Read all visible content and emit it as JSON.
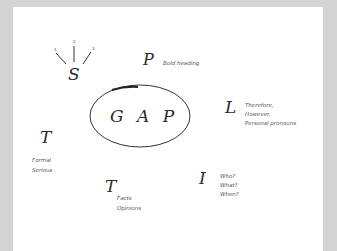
{
  "diagram": {
    "center": {
      "label": "G A P"
    },
    "nodes": [
      {
        "id": "S",
        "letter": "S",
        "marks": [
          "1",
          "2",
          "3"
        ],
        "notes": []
      },
      {
        "id": "P",
        "letter": "P",
        "notes": [
          "Bold heading"
        ]
      },
      {
        "id": "L",
        "letter": "L",
        "notes": [
          "Therefore,",
          "However,",
          "Personal pronouns"
        ]
      },
      {
        "id": "T1",
        "letter": "T",
        "notes": [
          "Formal",
          "Serious"
        ]
      },
      {
        "id": "T2",
        "letter": "T",
        "notes": [
          "Facts",
          "Opinions"
        ]
      },
      {
        "id": "I",
        "letter": "I",
        "notes": [
          "Who?",
          "What?",
          "When?"
        ]
      }
    ]
  },
  "colors": {
    "background": "#d4d4d4",
    "paper": "#ffffff",
    "ink": "#2a2a2a"
  }
}
